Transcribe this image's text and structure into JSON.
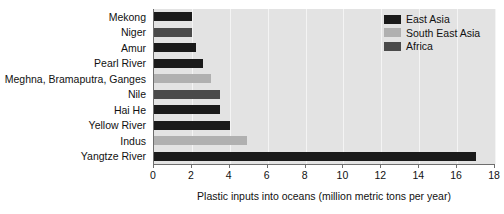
{
  "chart_data": {
    "type": "bar",
    "orientation": "horizontal",
    "title": "",
    "xlabel": "Plastic inputs into oceans (million metric tons per year)",
    "ylabel": "",
    "xlim": [
      0,
      18
    ],
    "ylim": null,
    "xticks": [
      0,
      2,
      4,
      6,
      8,
      10,
      12,
      14,
      16,
      18
    ],
    "xticklabels": [
      "0",
      "2",
      "4",
      "6",
      "8",
      "10",
      "12",
      "14",
      "16",
      "18"
    ],
    "grid": true,
    "grid_axis": "x",
    "legend_position": "top-right",
    "categories": [
      "Mekong",
      "Niger",
      "Amur",
      "Pearl River",
      "Meghna, Bramaputra, Ganges",
      "Nile",
      "Hai He",
      "Yellow River",
      "Indus",
      "Yangtze River"
    ],
    "values": [
      2.0,
      2.0,
      2.2,
      2.6,
      3.0,
      3.5,
      3.5,
      4.0,
      4.9,
      17.0
    ],
    "point_groups": [
      "East Asia",
      "Africa",
      "East Asia",
      "East Asia",
      "South East Asia",
      "Africa",
      "East Asia",
      "East Asia",
      "South East Asia",
      "East Asia"
    ],
    "series": [
      {
        "name": "East Asia",
        "color": "#1a1a1a",
        "points": [
          {
            "category": "Mekong",
            "value": 2.0
          },
          {
            "category": "Amur",
            "value": 2.2
          },
          {
            "category": "Pearl River",
            "value": 2.6
          },
          {
            "category": "Hai He",
            "value": 3.5
          },
          {
            "category": "Yellow River",
            "value": 4.0
          },
          {
            "category": "Yangtze River",
            "value": 17.0
          }
        ]
      },
      {
        "name": "South East Asia",
        "color": "#b0b0b0",
        "points": [
          {
            "category": "Meghna, Bramaputra, Ganges",
            "value": 3.0
          },
          {
            "category": "Indus",
            "value": 4.9
          }
        ]
      },
      {
        "name": "Africa",
        "color": "#4a4a4a",
        "points": [
          {
            "category": "Niger",
            "value": 2.0
          },
          {
            "category": "Nile",
            "value": 3.5
          }
        ]
      }
    ],
    "legend": [
      {
        "label": "East Asia",
        "color": "#1a1a1a"
      },
      {
        "label": "South East Asia",
        "color": "#b0b0b0"
      },
      {
        "label": "Africa",
        "color": "#4a4a4a"
      }
    ],
    "plot_background": "#e3e3e3",
    "figure_background": "#ffffff",
    "axis_color": "#6e6e6e",
    "text_color": "#111111"
  }
}
